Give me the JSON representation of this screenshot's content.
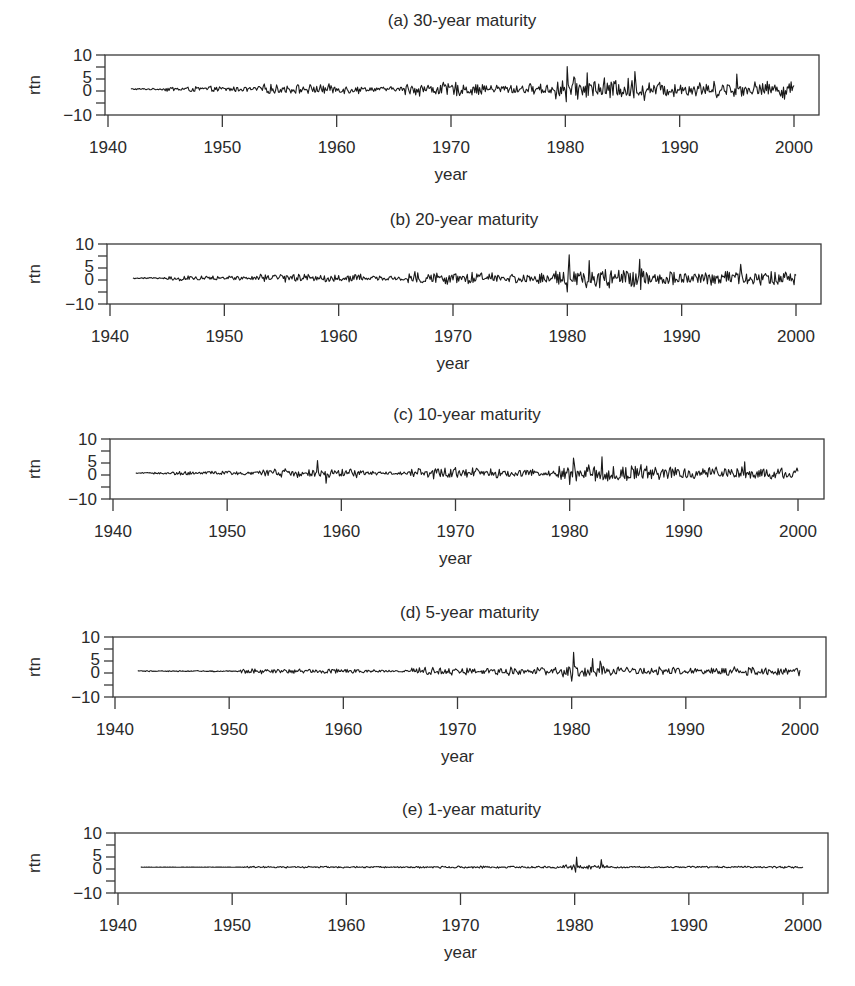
{
  "figure": {
    "panels": [
      {
        "id": "a",
        "title": "(a) 30-year maturity",
        "ylabel": "rtn",
        "xlabel": "year",
        "box": {
          "left": 105,
          "top": 55,
          "right": 819,
          "bottom": 115
        },
        "title_y": 26,
        "x1940": 108,
        "x2000": 794
      },
      {
        "id": "b",
        "title": "(b) 20-year maturity",
        "ylabel": "rtn",
        "xlabel": "year",
        "box": {
          "left": 107,
          "top": 244,
          "right": 821,
          "bottom": 304
        },
        "title_y": 225,
        "x1940": 110,
        "x2000": 796
      },
      {
        "id": "c",
        "title": "(c) 10-year maturity",
        "ylabel": "rtn",
        "xlabel": "year",
        "box": {
          "left": 110,
          "top": 439,
          "right": 824,
          "bottom": 499
        },
        "title_y": 420,
        "x1940": 113,
        "x2000": 798
      },
      {
        "id": "d",
        "title": "(d) 5-year maturity",
        "ylabel": "rtn",
        "xlabel": "year",
        "box": {
          "left": 113,
          "top": 637,
          "right": 826,
          "bottom": 697
        },
        "title_y": 618,
        "x1940": 115,
        "x2000": 800
      },
      {
        "id": "e",
        "title": "(e) 1-year maturity",
        "ylabel": "rtn",
        "xlabel": "year",
        "box": {
          "left": 115,
          "top": 833,
          "right": 828,
          "bottom": 893
        },
        "title_y": 815,
        "x1940": 118,
        "x2000": 803
      }
    ],
    "colors": {
      "line": "#1a1a1a",
      "frame": "#3a3a3a",
      "text": "#2a2a2a"
    }
  },
  "chart_data": [
    {
      "type": "line",
      "title": "(a) 30-year maturity",
      "xlabel": "year",
      "ylabel": "rtn",
      "x_range": [
        1942,
        2000
      ],
      "x_ticks": [
        1940,
        1950,
        1960,
        1970,
        1980,
        1990,
        2000
      ],
      "y_tick_labels": [
        "10",
        "5",
        "0",
        "-10"
      ],
      "ylim": [
        -10,
        10
      ],
      "frequency": "monthly",
      "baseline_mean": 0.5,
      "volatility_regimes": [
        {
          "from": 1942,
          "to": 1945,
          "amp": 0.3
        },
        {
          "from": 1945,
          "to": 1953,
          "amp": 1.0
        },
        {
          "from": 1953,
          "to": 1962,
          "amp": 1.8
        },
        {
          "from": 1962,
          "to": 1966,
          "amp": 0.9
        },
        {
          "from": 1966,
          "to": 1972,
          "amp": 2.6
        },
        {
          "from": 1972,
          "to": 1979,
          "amp": 2.0
        },
        {
          "from": 1979,
          "to": 1987,
          "amp": 4.2
        },
        {
          "from": 1987,
          "to": 2000,
          "amp": 3.0
        }
      ],
      "notable_points": [
        {
          "x": 1980.2,
          "y": 9.5
        },
        {
          "x": 1980.1,
          "y": -4.5
        },
        {
          "x": 1981.9,
          "y": 7
        },
        {
          "x": 1986.1,
          "y": 7.5
        },
        {
          "x": 1995.0,
          "y": 6.5
        },
        {
          "x": 1999.2,
          "y": -3.5
        }
      ]
    },
    {
      "type": "line",
      "title": "(b) 20-year maturity",
      "xlabel": "year",
      "ylabel": "rtn",
      "x_range": [
        1942,
        2000
      ],
      "x_ticks": [
        1940,
        1950,
        1960,
        1970,
        1980,
        1990,
        2000
      ],
      "y_tick_labels": [
        "10",
        "5",
        "0",
        "-10"
      ],
      "ylim": [
        -10,
        10
      ],
      "frequency": "monthly",
      "baseline_mean": 0.5,
      "volatility_regimes": [
        {
          "from": 1942,
          "to": 1945,
          "amp": 0.3
        },
        {
          "from": 1945,
          "to": 1953,
          "amp": 0.9
        },
        {
          "from": 1953,
          "to": 1962,
          "amp": 1.7
        },
        {
          "from": 1962,
          "to": 1966,
          "amp": 0.8
        },
        {
          "from": 1966,
          "to": 1972,
          "amp": 2.4
        },
        {
          "from": 1972,
          "to": 1979,
          "amp": 1.9
        },
        {
          "from": 1979,
          "to": 1987,
          "amp": 3.9
        },
        {
          "from": 1987,
          "to": 2000,
          "amp": 2.7
        }
      ],
      "notable_points": [
        {
          "x": 1980.2,
          "y": 10
        },
        {
          "x": 1980.0,
          "y": -5
        },
        {
          "x": 1981.9,
          "y": 7.5
        },
        {
          "x": 1986.3,
          "y": 8
        },
        {
          "x": 1986.4,
          "y": -4
        },
        {
          "x": 1995.2,
          "y": 6
        }
      ]
    },
    {
      "type": "line",
      "title": "(c) 10-year maturity",
      "xlabel": "year",
      "ylabel": "rtn",
      "x_range": [
        1942,
        2000
      ],
      "x_ticks": [
        1940,
        1950,
        1960,
        1970,
        1980,
        1990,
        2000
      ],
      "y_tick_labels": [
        "10",
        "5",
        "0",
        "-10"
      ],
      "ylim": [
        -10,
        10
      ],
      "frequency": "monthly",
      "baseline_mean": 0.5,
      "volatility_regimes": [
        {
          "from": 1942,
          "to": 1945,
          "amp": 0.3
        },
        {
          "from": 1945,
          "to": 1953,
          "amp": 0.8
        },
        {
          "from": 1953,
          "to": 1962,
          "amp": 1.6
        },
        {
          "from": 1962,
          "to": 1966,
          "amp": 0.7
        },
        {
          "from": 1966,
          "to": 1972,
          "amp": 2.2
        },
        {
          "from": 1972,
          "to": 1979,
          "amp": 1.6
        },
        {
          "from": 1979,
          "to": 1987,
          "amp": 3.3
        },
        {
          "from": 1987,
          "to": 2000,
          "amp": 2.3
        }
      ],
      "notable_points": [
        {
          "x": 1957.9,
          "y": 5.5
        },
        {
          "x": 1958.7,
          "y": -3.5
        },
        {
          "x": 1980.3,
          "y": 6.5
        },
        {
          "x": 1980.0,
          "y": -4
        },
        {
          "x": 1982.8,
          "y": 7
        },
        {
          "x": 1995.3,
          "y": 5
        }
      ]
    },
    {
      "type": "line",
      "title": "(d) 5-year maturity",
      "xlabel": "year",
      "ylabel": "rtn",
      "x_range": [
        1942,
        2000
      ],
      "x_ticks": [
        1940,
        1950,
        1960,
        1970,
        1980,
        1990,
        2000
      ],
      "y_tick_labels": [
        "10",
        "5",
        "0",
        "-10"
      ],
      "ylim": [
        -10,
        10
      ],
      "frequency": "monthly",
      "baseline_mean": 0.5,
      "volatility_regimes": [
        {
          "from": 1942,
          "to": 1951,
          "amp": 0.2
        },
        {
          "from": 1951,
          "to": 1962,
          "amp": 0.9
        },
        {
          "from": 1962,
          "to": 1966,
          "amp": 0.5
        },
        {
          "from": 1966,
          "to": 1979,
          "amp": 1.5
        },
        {
          "from": 1979,
          "to": 1983,
          "amp": 2.6
        },
        {
          "from": 1983,
          "to": 2000,
          "amp": 1.6
        }
      ],
      "notable_points": [
        {
          "x": 1980.2,
          "y": 8
        },
        {
          "x": 1980.0,
          "y": -3.5
        },
        {
          "x": 1981.8,
          "y": 5.5
        },
        {
          "x": 1982.5,
          "y": 4.5
        }
      ]
    },
    {
      "type": "line",
      "title": "(e) 1-year maturity",
      "xlabel": "year",
      "ylabel": "rtn",
      "x_range": [
        1942,
        2000
      ],
      "x_ticks": [
        1940,
        1950,
        1960,
        1970,
        1980,
        1990,
        2000
      ],
      "y_tick_labels": [
        "10",
        "5",
        "0",
        "-10"
      ],
      "ylim": [
        -10,
        10
      ],
      "frequency": "monthly",
      "baseline_mean": 0.5,
      "volatility_regimes": [
        {
          "from": 1942,
          "to": 1951,
          "amp": 0.05
        },
        {
          "from": 1951,
          "to": 1966,
          "amp": 0.3
        },
        {
          "from": 1966,
          "to": 1979,
          "amp": 0.4
        },
        {
          "from": 1979,
          "to": 1983,
          "amp": 1.0
        },
        {
          "from": 1983,
          "to": 2000,
          "amp": 0.35
        }
      ],
      "notable_points": [
        {
          "x": 1980.2,
          "y": 4.5
        },
        {
          "x": 1980.1,
          "y": -1.5
        },
        {
          "x": 1982.3,
          "y": 3.5
        }
      ]
    }
  ]
}
